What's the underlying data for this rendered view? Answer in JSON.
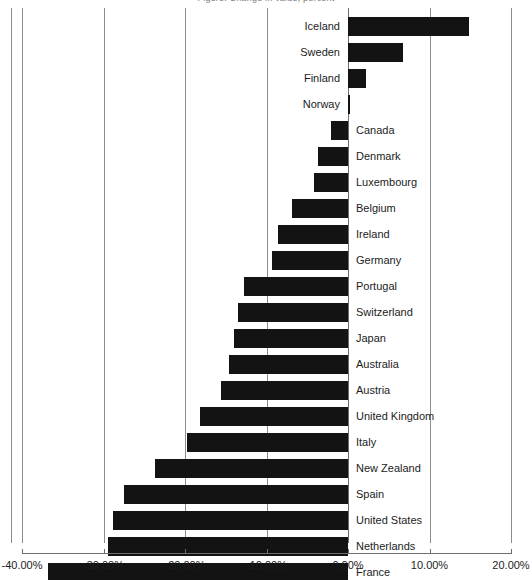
{
  "chart": {
    "title_clipped": "Figure: Change in value, percent",
    "bar_color": "#131313",
    "grid_color": "#8d8d8d",
    "axis_color": "#6e6e6e"
  },
  "chart_data": {
    "type": "bar",
    "orientation": "horizontal",
    "title": "",
    "xlabel": "",
    "ylabel": "",
    "xlim": [
      -40,
      20
    ],
    "grid": true,
    "legend": false,
    "tick_labels": [
      "-40.00%",
      "-30.00%",
      "-20.00%",
      "-10.00%",
      "0.00%",
      "10.00%",
      "20.00%"
    ],
    "tick_values": [
      -40,
      -30,
      -20,
      -10,
      0,
      10,
      20
    ],
    "categories": [
      "Iceland",
      "Sweden",
      "Finland",
      "Norway",
      "Canada",
      "Denmark",
      "Luxembourg",
      "Belgium",
      "Ireland",
      "Germany",
      "Portugal",
      "Switzerland",
      "Japan",
      "Australia",
      "Austria",
      "United Kingdom",
      "Italy",
      "New Zealand",
      "Spain",
      "United States",
      "Netherlands",
      "France"
    ],
    "values": [
      14.8,
      6.7,
      2.2,
      0.3,
      -2.1,
      -3.7,
      -4.2,
      -6.9,
      -8.6,
      -9.3,
      -12.8,
      -13.5,
      -14.0,
      -14.6,
      -15.6,
      -18.2,
      -19.8,
      -23.7,
      -27.5,
      -28.8,
      -29.5,
      -36.8
    ]
  }
}
